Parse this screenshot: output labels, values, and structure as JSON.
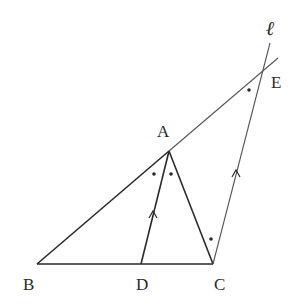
{
  "diagram": {
    "type": "geometry",
    "points": {
      "A": {
        "label": "A",
        "x": 169,
        "y": 151
      },
      "B": {
        "label": "B",
        "x": 37,
        "y": 264
      },
      "C": {
        "label": "C",
        "x": 213,
        "y": 264
      },
      "D": {
        "label": "D",
        "x": 141,
        "y": 264
      },
      "E": {
        "label": "E",
        "x": 263,
        "y": 69
      }
    },
    "line_label": "ℓ",
    "segments": [
      "AB",
      "BC",
      "AC",
      "AD",
      "CE",
      "AE (extended line through B and A)"
    ],
    "parallel_marks": [
      "AD",
      "CE"
    ],
    "equal_angle_marks": [
      "∠BAD",
      "∠DAC",
      "∠ACE",
      "∠AEC"
    ],
    "colors": {
      "stroke": "#2a2a2a",
      "background": "#ffffff"
    }
  }
}
